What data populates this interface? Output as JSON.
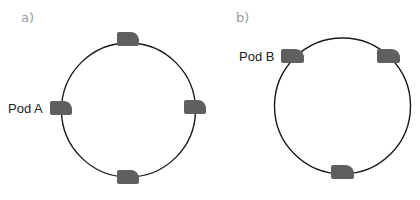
{
  "panels": [
    {
      "label": "a)",
      "ring": "circle",
      "pods": [
        {
          "position": "top"
        },
        {
          "position": "left",
          "label": "Pod A"
        },
        {
          "position": "right"
        },
        {
          "position": "bottom"
        }
      ]
    },
    {
      "label": "b)",
      "ring": "circle",
      "pods": [
        {
          "position": "top-left",
          "label": "Pod B"
        },
        {
          "position": "top-right"
        },
        {
          "position": "bottom"
        }
      ]
    }
  ],
  "colors": {
    "pod": "#5f5f5f",
    "ring": "#1a1a1a",
    "panel_label": "#9a9a9a",
    "pod_label": "#222222"
  }
}
